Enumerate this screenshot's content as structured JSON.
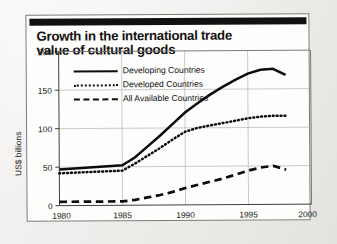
{
  "figure": {
    "title": "Growth in the international trade value of cultural goods",
    "title_line1": "Growth in the international trade",
    "title_line2": "value of cultural goods",
    "source": "Source: International flows of selected cultural goods 1980-98 (UNESCO 2000)"
  },
  "legend": {
    "position": "top-left-inside-plot",
    "entries": [
      {
        "label": "Developing Countries",
        "style": "solid"
      },
      {
        "label": "Developed Countries",
        "style": "dotted"
      },
      {
        "label": "All Available Countries",
        "style": "dashed"
      }
    ]
  },
  "chart_data": {
    "type": "line",
    "title": "Growth in the international trade value of cultural goods",
    "xlabel": "",
    "ylabel": "US$ billions",
    "xlim": [
      1980,
      2000
    ],
    "ylim": [
      0,
      200
    ],
    "xticks": [
      1980,
      1985,
      1990,
      1995,
      2000
    ],
    "yticks": [
      0,
      50,
      100,
      150,
      200
    ],
    "xtick_labels": [
      "1980",
      "1985",
      "1990",
      "1995",
      "2000"
    ],
    "ytick_labels": [
      "0",
      "50",
      "100",
      "150",
      "200"
    ],
    "grid": true,
    "x": [
      1980,
      1985,
      1986,
      1987,
      1988,
      1989,
      1990,
      1991,
      1992,
      1993,
      1994,
      1995,
      1996,
      1997,
      1998
    ],
    "series": [
      {
        "name": "Developing Countries",
        "style": "solid",
        "values": [
          47,
          52,
          62,
          76,
          90,
          105,
          120,
          132,
          143,
          153,
          162,
          170,
          175,
          176,
          168
        ]
      },
      {
        "name": "Developed Countries",
        "style": "dotted",
        "values": [
          42,
          45,
          54,
          64,
          74,
          85,
          95,
          100,
          103,
          106,
          109,
          112,
          114,
          115,
          115
        ]
      },
      {
        "name": "All Available Countries",
        "style": "dashed",
        "values": [
          5,
          5,
          7,
          10,
          13,
          17,
          22,
          26,
          30,
          34,
          39,
          44,
          48,
          50,
          45
        ]
      }
    ]
  }
}
